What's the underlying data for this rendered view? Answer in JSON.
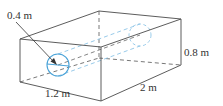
{
  "figure": {
    "type": "box-with-cylindrical-hole",
    "labels": {
      "diameter": "0.4 m",
      "width": "1.2 m",
      "length": "2 m",
      "height": "0.8 m"
    },
    "colors": {
      "edge": "#4a4a4a",
      "hidden_edge": "#555555",
      "cylinder": "#4aa3d8",
      "cylinder_hidden": "#8cc4e6",
      "text": "#333333"
    }
  }
}
